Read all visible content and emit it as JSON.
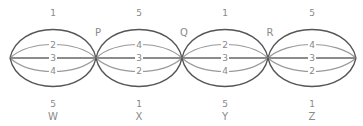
{
  "nodes": [
    {
      "id": "n0",
      "x": 10
    },
    {
      "id": "P",
      "x": 96,
      "label": "P"
    },
    {
      "id": "Q",
      "x": 182,
      "label": "Q"
    },
    {
      "id": "R",
      "x": 268,
      "label": "R"
    },
    {
      "id": "n4",
      "x": 356
    }
  ],
  "center_y": 58,
  "segments": [
    {
      "name": "W",
      "bottom_label": "W",
      "top": "1",
      "upper": "2",
      "middle": "3",
      "lower": "4",
      "bottom": "5"
    },
    {
      "name": "X",
      "bottom_label": "X",
      "top": "5",
      "upper": "4",
      "middle": "3",
      "lower": "2",
      "bottom": "1"
    },
    {
      "name": "Y",
      "bottom_label": "Y",
      "top": "1",
      "upper": "2",
      "middle": "3",
      "lower": "4",
      "bottom": "5"
    },
    {
      "name": "Z",
      "bottom_label": "Z",
      "top": "5",
      "upper": "4",
      "middle": "3",
      "lower": "2",
      "bottom": "1"
    }
  ],
  "node_labels": [
    "P",
    "Q",
    "R"
  ],
  "colors": {
    "outer": "#555555",
    "inner": "#9a9a9a",
    "text": "#888888"
  }
}
